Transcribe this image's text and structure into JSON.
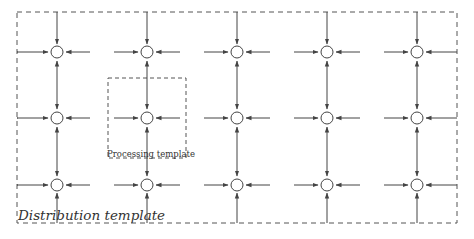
{
  "diagram": {
    "outer_template": {
      "label": "Distribution template",
      "x1": 17,
      "y1": 12,
      "x2": 457,
      "y2": 223
    },
    "inner_template": {
      "label": "Processing template",
      "x1": 108,
      "y1": 78,
      "x2": 186,
      "y2": 158
    },
    "grid": {
      "columns_x": [
        57,
        147,
        237,
        327,
        417
      ],
      "rows_y": [
        52,
        118,
        185
      ],
      "node_radius": 6
    },
    "colors": {
      "stroke": "#444444",
      "dash": "#555555",
      "text": "#333333"
    }
  }
}
